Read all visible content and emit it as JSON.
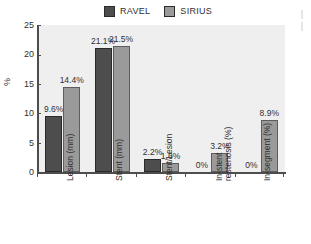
{
  "chart_data": {
    "type": "bar",
    "title": "",
    "xlabel": "",
    "ylabel": "%",
    "ylim": [
      0,
      25
    ],
    "yticks": [
      0,
      5,
      10,
      15,
      20,
      25
    ],
    "grid": false,
    "legend_position": "top-center",
    "categories": [
      "Lesion (mm)",
      "Stent (mm)",
      "Stent/Lesion",
      "In-stent restenosis (%)",
      "In-segment (%)"
    ],
    "category_lines": [
      [
        "Lesion (mm)"
      ],
      [
        "Stent (mm)"
      ],
      [
        "Stent/Lesion"
      ],
      [
        "In-stent",
        "restenosis (%)"
      ],
      [
        "In-segment (%)"
      ]
    ],
    "series": [
      {
        "name": "RAVEL",
        "color": "#4d4d4d",
        "values": [
          9.6,
          21.1,
          2.2,
          0,
          0
        ],
        "labels": [
          "9.6%",
          "21.1%",
          "2.2%",
          "0%",
          "0%"
        ]
      },
      {
        "name": "SIRIUS",
        "color": "#9a9a9a",
        "values": [
          14.4,
          21.5,
          1.6,
          3.2,
          8.9
        ],
        "labels": [
          "14.4%",
          "21.5%",
          "1.6%",
          "3.2%",
          "8.9%"
        ]
      }
    ]
  },
  "legend": {
    "entries": [
      {
        "label": "RAVEL",
        "color": "#4d4d4d"
      },
      {
        "label": "SIRIUS",
        "color": "#9a9a9a"
      }
    ]
  },
  "axes": {
    "y_label": "%",
    "y_ticks": [
      "25",
      "20",
      "15",
      "10",
      "5",
      "0"
    ]
  }
}
